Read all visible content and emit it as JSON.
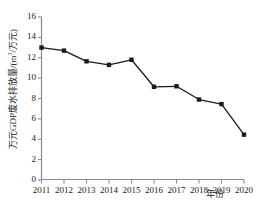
{
  "chart_data": {
    "type": "line",
    "title": "",
    "subtitle": "",
    "xlabel": "年份",
    "ylabel": "万元GDP废水排放量/(m³/万元)",
    "ylabel_parts": {
      "prefix": "万元GDP废水排放量/(m",
      "superscript": "3",
      "suffix": "/万元)"
    },
    "categories": [
      "2011",
      "2012",
      "2013",
      "2014",
      "2015",
      "2016",
      "2017",
      "2018",
      "2019",
      "2020"
    ],
    "x": [
      2011,
      2012,
      2013,
      2014,
      2015,
      2016,
      2017,
      2018,
      2019,
      2020
    ],
    "values": [
      13.0,
      12.7,
      11.65,
      11.3,
      11.8,
      9.15,
      9.2,
      7.9,
      7.45,
      4.45
    ],
    "xlim": [
      2011,
      2020
    ],
    "ylim": [
      0,
      16
    ],
    "yticks": [
      0,
      2,
      4,
      6,
      8,
      10,
      12,
      14,
      16
    ],
    "ytick_labels": [
      "0",
      "2",
      "4",
      "6",
      "8",
      "10",
      "12",
      "14",
      "16"
    ],
    "xticks": [
      2011,
      2012,
      2013,
      2014,
      2015,
      2016,
      2017,
      2018,
      2019,
      2020
    ],
    "grid": false,
    "legend": null,
    "legend_position": "none",
    "marker": "square",
    "line_color": "#1a1a1a",
    "marker_color": "#1a1a1a",
    "axis_color": "#7a7a7a",
    "background_color": "#ffffff"
  }
}
